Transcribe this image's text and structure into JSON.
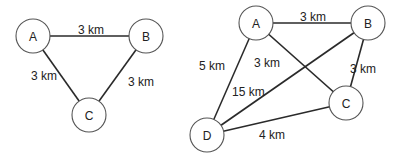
{
  "graphs": [
    {
      "nodes": [
        {
          "id": "A",
          "label": "A",
          "x": 33,
          "y": 36
        },
        {
          "id": "B",
          "label": "B",
          "x": 146,
          "y": 36
        },
        {
          "id": "C",
          "label": "C",
          "x": 89,
          "y": 115
        }
      ],
      "edges": [
        {
          "from": "A",
          "to": "B",
          "label": "3 km",
          "lx": 78,
          "ly": 34
        },
        {
          "from": "A",
          "to": "C",
          "label": "3 km",
          "lx": 31,
          "ly": 80
        },
        {
          "from": "B",
          "to": "C",
          "label": "3 km",
          "lx": 128,
          "ly": 86
        }
      ]
    },
    {
      "nodes": [
        {
          "id": "A",
          "label": "A",
          "x": 256,
          "y": 23
        },
        {
          "id": "B",
          "label": "B",
          "x": 368,
          "y": 23
        },
        {
          "id": "C",
          "label": "C",
          "x": 346,
          "y": 103
        },
        {
          "id": "D",
          "label": "D",
          "x": 207,
          "y": 135
        }
      ],
      "edges": [
        {
          "from": "A",
          "to": "B",
          "label": "3 km",
          "lx": 300,
          "ly": 21
        },
        {
          "from": "A",
          "to": "D",
          "label": "5 km",
          "lx": 199,
          "ly": 70
        },
        {
          "from": "A",
          "to": "C",
          "label": "3 km",
          "lx": 254,
          "ly": 67
        },
        {
          "from": "B",
          "to": "D",
          "label": "15 km",
          "lx": 232,
          "ly": 96
        },
        {
          "from": "B",
          "to": "C",
          "label": "3 km",
          "lx": 350,
          "ly": 73
        },
        {
          "from": "D",
          "to": "C",
          "label": "4 km",
          "lx": 259,
          "ly": 139
        }
      ]
    }
  ]
}
